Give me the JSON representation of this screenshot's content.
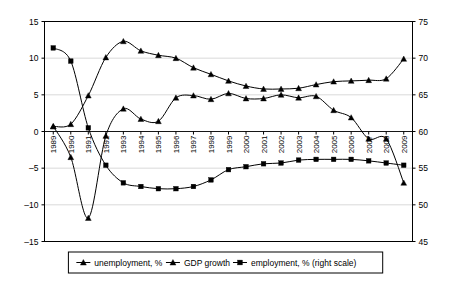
{
  "chart_data": {
    "type": "line",
    "title": "",
    "subtitle": "",
    "xlabel": "",
    "ylabel": "",
    "y2label": "",
    "categories": [
      "1989",
      "1990",
      "1991",
      "1992",
      "1993",
      "1994",
      "1995",
      "1996",
      "1997",
      "1998",
      "1999",
      "2000",
      "2001",
      "2002",
      "2003",
      "2004",
      "2005",
      "2006",
      "2007",
      "2008",
      "2009"
    ],
    "ylim": [
      -15,
      15
    ],
    "y2lim": [
      45,
      75
    ],
    "yticks": [
      -15,
      -10,
      -5,
      0,
      5,
      10,
      15
    ],
    "y2ticks": [
      45,
      50,
      55,
      60,
      65,
      70,
      75
    ],
    "grid": true,
    "legend_position": "bottom",
    "series": [
      {
        "name": "unemployment, %",
        "axis": "left",
        "marker": "triangle",
        "color": "#000000",
        "values": [
          0.7,
          1.0,
          4.9,
          10.1,
          12.3,
          11.0,
          10.4,
          10.0,
          8.7,
          7.8,
          6.9,
          6.2,
          5.8,
          5.8,
          5.9,
          6.4,
          6.8,
          6.9,
          7.0,
          7.2,
          9.9
        ]
      },
      {
        "name": "GDP growth",
        "axis": "left",
        "marker": "triangle",
        "color": "#000000",
        "values": [
          0.7,
          -3.5,
          -11.8,
          -0.6,
          3.1,
          1.7,
          1.4,
          4.6,
          4.9,
          4.4,
          5.2,
          4.5,
          4.5,
          5.0,
          4.6,
          4.8,
          2.9,
          1.9,
          -1.0,
          -1.0,
          -7.0
        ]
      },
      {
        "name": "employment, % (right scale)",
        "axis": "right",
        "marker": "square",
        "color": "#000000",
        "values": [
          71.4,
          69.6,
          60.5,
          55.4,
          53.0,
          52.5,
          52.2,
          52.2,
          52.5,
          53.4,
          54.8,
          55.2,
          55.6,
          55.7,
          56.1,
          56.2,
          56.2,
          56.2,
          56.0,
          55.7,
          55.4
        ]
      }
    ]
  },
  "legend": {
    "entries": [
      {
        "label": "unemployment, %",
        "marker": "triangle"
      },
      {
        "label": "GDP growth",
        "marker": "triangle"
      },
      {
        "label": "employment, % (right scale)",
        "marker": "square"
      }
    ]
  }
}
